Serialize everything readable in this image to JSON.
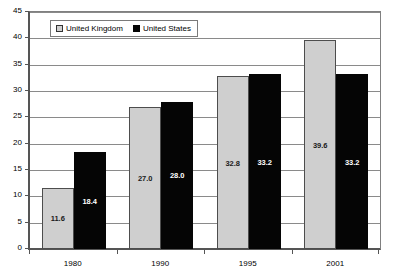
{
  "chart_data": {
    "type": "bar",
    "title": "",
    "subtitle": "",
    "xlabel": "",
    "ylabel": "",
    "categories": [
      "1980",
      "1990",
      "1995",
      "2001"
    ],
    "series": [
      {
        "name": "United Kingdom",
        "color": "#cfcfcf",
        "values": [
          11.6,
          27.0,
          32.8,
          39.6
        ],
        "labels": [
          "11.6",
          "27.0",
          "32.8",
          "39.6"
        ]
      },
      {
        "name": "United States",
        "color": "#050505",
        "values": [
          18.4,
          28.0,
          33.2,
          33.2
        ],
        "labels": [
          "18.4",
          "28.0",
          "33.2",
          "33.2"
        ]
      }
    ],
    "ylim": [
      0,
      45
    ],
    "ytick_step": 5,
    "yticks": [
      "0",
      "5",
      "10",
      "15",
      "20",
      "25",
      "30",
      "35",
      "40",
      "45"
    ],
    "grid": true,
    "grid_axis": "y",
    "legend_position": "top-left-inside",
    "data_labels": true
  },
  "legend": {
    "items": [
      {
        "label": "United Kingdom",
        "swatch": "legend-swatch-uk"
      },
      {
        "label": "United States",
        "swatch": "legend-swatch-us"
      }
    ]
  },
  "colors": {
    "series_uk": "#cfcfcf",
    "series_us": "#050505",
    "gridline": "#8a8a8a",
    "axis": "#555555",
    "background": "#ffffff"
  }
}
